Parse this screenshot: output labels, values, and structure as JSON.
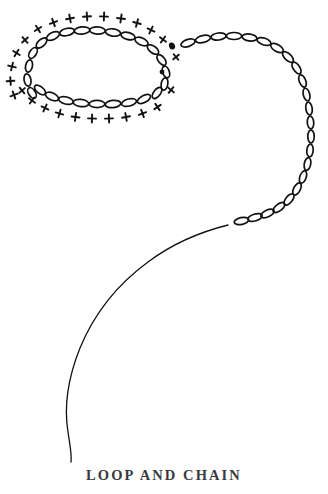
{
  "plate": {
    "caption": "LOOP AND CHAIN",
    "background_color": "#ffffff",
    "ink_color": "#111111",
    "caption_color": "#3a3a3e"
  },
  "figure": {
    "ink_color": "#111111",
    "stroke_width": 1.3,
    "crossing_dots": [
      {
        "cx": 172.0,
        "cy": 46.0,
        "rx": 3.0,
        "ry": 3.6,
        "rot": -20
      },
      {
        "cx": 162.0,
        "cy": 72.0,
        "rx": 2.4,
        "ry": 2.4,
        "rot": 0
      }
    ],
    "loop_chain_links": [
      {
        "cx": 33.0,
        "cy": 53.0,
        "rx": 6.0,
        "ry": 3.4,
        "rot": -58
      },
      {
        "cx": 29.0,
        "cy": 66.0,
        "rx": 6.2,
        "ry": 3.4,
        "rot": -78
      },
      {
        "cx": 27.5,
        "cy": 80.0,
        "rx": 6.2,
        "ry": 3.4,
        "rot": -100
      },
      {
        "cx": 32.0,
        "cy": 93.0,
        "rx": 6.0,
        "ry": 3.4,
        "rot": -122
      },
      {
        "cx": 41.5,
        "cy": 43.0,
        "rx": 6.5,
        "ry": 3.4,
        "rot": -42
      },
      {
        "cx": 53.0,
        "cy": 36.0,
        "rx": 7.0,
        "ry": 3.5,
        "rot": -26
      },
      {
        "cx": 67.0,
        "cy": 32.0,
        "rx": 7.5,
        "ry": 3.6,
        "rot": -13
      },
      {
        "cx": 82.0,
        "cy": 30.5,
        "rx": 7.8,
        "ry": 3.6,
        "rot": -5
      },
      {
        "cx": 97.5,
        "cy": 30.5,
        "rx": 7.8,
        "ry": 3.6,
        "rot": 2
      },
      {
        "cx": 113.0,
        "cy": 32.5,
        "rx": 7.6,
        "ry": 3.6,
        "rot": 8
      },
      {
        "cx": 128.0,
        "cy": 36.0,
        "rx": 7.2,
        "ry": 3.5,
        "rot": 15
      },
      {
        "cx": 141.5,
        "cy": 41.5,
        "rx": 7.0,
        "ry": 3.5,
        "rot": 24
      },
      {
        "cx": 153.0,
        "cy": 49.5,
        "rx": 6.6,
        "ry": 3.4,
        "rot": 36
      },
      {
        "cx": 161.5,
        "cy": 60.0,
        "rx": 6.2,
        "ry": 3.3,
        "rot": 52
      },
      {
        "cx": 166.0,
        "cy": 72.0,
        "rx": 6.0,
        "ry": 3.3,
        "rot": 70
      },
      {
        "cx": 164.5,
        "cy": 84.0,
        "rx": 6.2,
        "ry": 3.3,
        "rot": 100
      },
      {
        "cx": 157.0,
        "cy": 93.0,
        "rx": 6.5,
        "ry": 3.4,
        "rot": 128
      },
      {
        "cx": 144.0,
        "cy": 99.0,
        "rx": 7.2,
        "ry": 3.5,
        "rot": 152
      },
      {
        "cx": 129.0,
        "cy": 102.5,
        "rx": 7.6,
        "ry": 3.6,
        "rot": 166
      },
      {
        "cx": 113.0,
        "cy": 104.0,
        "rx": 7.8,
        "ry": 3.6,
        "rot": 174
      },
      {
        "cx": 97.0,
        "cy": 104.0,
        "rx": 7.8,
        "ry": 3.6,
        "rot": 180
      },
      {
        "cx": 81.0,
        "cy": 103.0,
        "rx": 7.8,
        "ry": 3.6,
        "rot": 187
      },
      {
        "cx": 66.0,
        "cy": 100.5,
        "rx": 7.5,
        "ry": 3.6,
        "rot": 194
      },
      {
        "cx": 52.0,
        "cy": 96.5,
        "rx": 7.0,
        "ry": 3.5,
        "rot": 204
      },
      {
        "cx": 40.0,
        "cy": 90.0,
        "rx": 6.5,
        "ry": 3.4,
        "rot": 218
      }
    ],
    "loop_cross_marks": [
      {
        "cx": 16.5,
        "cy": 53.0,
        "len": 7.6,
        "rot": 32
      },
      {
        "cx": 12.0,
        "cy": 66.5,
        "len": 7.8,
        "rot": 14
      },
      {
        "cx": 10.5,
        "cy": 81.0,
        "len": 7.8,
        "rot": -4
      },
      {
        "cx": 14.0,
        "cy": 95.0,
        "len": 7.6,
        "rot": -20
      },
      {
        "cx": 25.0,
        "cy": 40.0,
        "len": 7.6,
        "rot": 48
      },
      {
        "cx": 38.0,
        "cy": 29.0,
        "len": 7.6,
        "rot": 58
      },
      {
        "cx": 53.5,
        "cy": 22.5,
        "len": 7.8,
        "rot": 70
      },
      {
        "cx": 70.0,
        "cy": 18.5,
        "len": 8.0,
        "rot": 80
      },
      {
        "cx": 87.0,
        "cy": 16.5,
        "len": 8.0,
        "rot": 86
      },
      {
        "cx": 104.0,
        "cy": 16.5,
        "len": 8.0,
        "rot": 92
      },
      {
        "cx": 121.0,
        "cy": 18.5,
        "len": 8.0,
        "rot": 98
      },
      {
        "cx": 137.0,
        "cy": 23.0,
        "len": 7.8,
        "rot": 105
      },
      {
        "cx": 151.0,
        "cy": 30.0,
        "len": 7.6,
        "rot": 115
      },
      {
        "cx": 163.0,
        "cy": 39.5,
        "len": 7.4,
        "rot": 126
      },
      {
        "cx": 176.0,
        "cy": 57.0,
        "len": 7.2,
        "rot": 140
      },
      {
        "cx": 171.0,
        "cy": 90.0,
        "len": 7.4,
        "rot": 40
      },
      {
        "cx": 157.5,
        "cy": 107.0,
        "len": 7.6,
        "rot": 56
      },
      {
        "cx": 142.5,
        "cy": 113.5,
        "len": 7.8,
        "rot": 70
      },
      {
        "cx": 126.0,
        "cy": 117.0,
        "len": 8.0,
        "rot": 80
      },
      {
        "cx": 109.0,
        "cy": 118.5,
        "len": 8.0,
        "rot": 88
      },
      {
        "cx": 92.0,
        "cy": 118.5,
        "len": 8.0,
        "rot": 92
      },
      {
        "cx": 75.5,
        "cy": 117.0,
        "len": 8.0,
        "rot": 98
      },
      {
        "cx": 59.5,
        "cy": 113.5,
        "len": 7.8,
        "rot": 106
      },
      {
        "cx": 45.0,
        "cy": 108.0,
        "len": 7.6,
        "rot": 115
      },
      {
        "cx": 32.0,
        "cy": 100.5,
        "len": 7.4,
        "rot": 126
      },
      {
        "cx": 22.0,
        "cy": 90.5,
        "len": 7.4,
        "rot": 140
      }
    ],
    "trail_chain_links": [
      {
        "cx": 188.0,
        "cy": 43.0,
        "rx": 7.4,
        "ry": 3.5,
        "rot": -18
      },
      {
        "cx": 203.0,
        "cy": 39.0,
        "rx": 7.6,
        "ry": 3.5,
        "rot": -13
      },
      {
        "cx": 218.5,
        "cy": 36.5,
        "rx": 7.6,
        "ry": 3.5,
        "rot": -7
      },
      {
        "cx": 234.0,
        "cy": 36.0,
        "rx": 7.6,
        "ry": 3.5,
        "rot": 0
      },
      {
        "cx": 249.5,
        "cy": 37.5,
        "rx": 7.4,
        "ry": 3.5,
        "rot": 8
      },
      {
        "cx": 264.0,
        "cy": 41.5,
        "rx": 7.2,
        "ry": 3.4,
        "rot": 18
      },
      {
        "cx": 277.0,
        "cy": 48.0,
        "rx": 7.0,
        "ry": 3.4,
        "rot": 30
      },
      {
        "cx": 288.0,
        "cy": 57.0,
        "rx": 6.8,
        "ry": 3.3,
        "rot": 44
      },
      {
        "cx": 296.5,
        "cy": 68.0,
        "rx": 6.6,
        "ry": 3.3,
        "rot": 56
      },
      {
        "cx": 302.5,
        "cy": 81.0,
        "rx": 6.4,
        "ry": 3.2,
        "rot": 68
      },
      {
        "cx": 306.5,
        "cy": 94.5,
        "rx": 6.4,
        "ry": 3.2,
        "rot": 76
      },
      {
        "cx": 309.0,
        "cy": 108.5,
        "rx": 6.4,
        "ry": 3.2,
        "rot": 82
      },
      {
        "cx": 310.5,
        "cy": 122.5,
        "rx": 6.4,
        "ry": 3.2,
        "rot": 86
      },
      {
        "cx": 311.0,
        "cy": 136.5,
        "rx": 6.4,
        "ry": 3.2,
        "rot": 90
      },
      {
        "cx": 310.0,
        "cy": 150.5,
        "rx": 6.4,
        "ry": 3.2,
        "rot": 95
      },
      {
        "cx": 307.5,
        "cy": 164.0,
        "rx": 6.4,
        "ry": 3.2,
        "rot": 101
      },
      {
        "cx": 303.0,
        "cy": 177.0,
        "rx": 6.4,
        "ry": 3.2,
        "rot": 109
      },
      {
        "cx": 297.0,
        "cy": 189.0,
        "rx": 6.6,
        "ry": 3.3,
        "rot": 118
      },
      {
        "cx": 289.0,
        "cy": 199.5,
        "rx": 6.8,
        "ry": 3.3,
        "rot": 129
      },
      {
        "cx": 279.0,
        "cy": 207.5,
        "rx": 7.0,
        "ry": 3.4,
        "rot": 142
      },
      {
        "cx": 267.5,
        "cy": 213.5,
        "rx": 7.2,
        "ry": 3.4,
        "rot": 154
      },
      {
        "cx": 255.0,
        "cy": 217.5,
        "rx": 7.4,
        "ry": 3.4,
        "rot": 163
      },
      {
        "cx": 241.5,
        "cy": 221.0,
        "rx": 7.4,
        "ry": 3.4,
        "rot": 168
      }
    ],
    "tail_path": "M 228 225 C 200 232 172 244 148 262 C 118 284 94 314 80 348 C 68 378 64 408 68 432 C 70 446 72 455 71 462",
    "loop_end_path": "M 176 48 C 178 50 180 52 181 54"
  }
}
